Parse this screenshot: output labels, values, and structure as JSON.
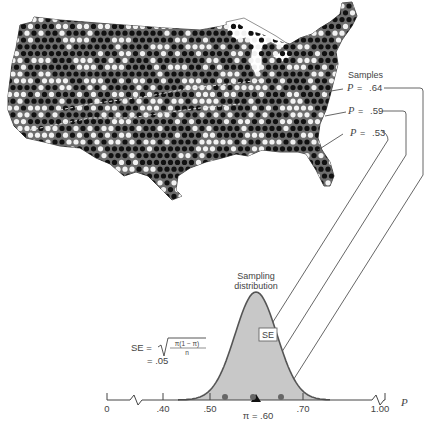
{
  "map": {
    "description": "Map of the United States filled with black and white dots representing population",
    "fill_color": "#6e6e6e",
    "dot_black": "#111111",
    "dot_white": "#f2f2f2"
  },
  "samples": {
    "heading": "Samples",
    "items": [
      {
        "symbol": "P",
        "eq": "=",
        "value": ".64"
      },
      {
        "symbol": "P",
        "eq": "=",
        "value": ".59"
      },
      {
        "symbol": "P",
        "eq": "=",
        "value": ".53"
      }
    ]
  },
  "sampling_distribution": {
    "title_line1": "Sampling",
    "title_line2": "distribution",
    "se_box": "SE",
    "fill": "#c8c8c8",
    "stroke": "#555555"
  },
  "formula": {
    "lhs": "SE =",
    "numerator": "π(1 − π)",
    "denominator": "n",
    "result_line": "= .05"
  },
  "axis": {
    "ticks": [
      "0",
      ".40",
      ".50",
      ".70",
      "1.00"
    ],
    "variable": "P",
    "mean_label": "π = .60"
  },
  "chart_data": {
    "type": "diagram",
    "title": "Sampling distribution",
    "population_proportion": 0.6,
    "standard_error": 0.05,
    "sample_proportions": [
      0.64,
      0.59,
      0.53
    ],
    "axis_ticks": [
      0,
      0.4,
      0.5,
      0.6,
      0.7,
      1.0
    ],
    "xlabel": "P"
  }
}
